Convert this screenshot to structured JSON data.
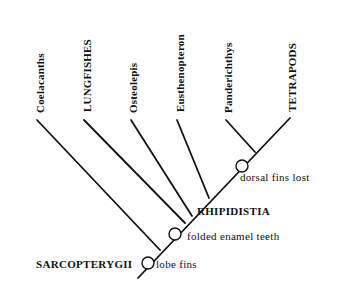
{
  "diagram": {
    "type": "cladogram",
    "taxa": [
      {
        "label": "Coelacanths",
        "tip": [
          37,
          120
        ],
        "join": [
          160,
          250
        ],
        "label_x": 44,
        "label_y": 113
      },
      {
        "label": "LUNGFISHES",
        "tip": [
          84,
          120
        ],
        "join": [
          185,
          223
        ],
        "label_x": 91,
        "label_y": 112
      },
      {
        "label": "Osteolepis",
        "tip": [
          131,
          120
        ],
        "join": [
          192,
          216
        ],
        "label_x": 137,
        "label_y": 113
      },
      {
        "label": "Eusthenopteron",
        "tip": [
          177,
          120
        ],
        "join": [
          209,
          198
        ],
        "label_x": 184,
        "label_y": 112
      },
      {
        "label": "Panderichthys",
        "tip": [
          226,
          120
        ],
        "join": [
          255,
          152
        ],
        "label_x": 232,
        "label_y": 113
      },
      {
        "label": "TETRAPODS",
        "tip": [
          290,
          118
        ],
        "join": [
          255,
          152
        ],
        "label_x": 296,
        "label_y": 112
      }
    ],
    "trunk": {
      "start": [
        138,
        278
      ],
      "end": [
        290,
        118
      ]
    },
    "clades": [
      {
        "label": "SARCOPTERYGII",
        "x": 36,
        "y": 268
      },
      {
        "label": "RHIPIDISTIA",
        "x": 197,
        "y": 215
      }
    ],
    "traits": [
      {
        "label": "lobe fins",
        "circle": [
          148,
          263
        ],
        "x": 156,
        "y": 268
      },
      {
        "label": "folded enamel teeth",
        "circle": [
          175,
          234
        ],
        "x": 187,
        "y": 240
      },
      {
        "label": "dorsal fins lost",
        "circle": [
          242,
          166
        ],
        "x": 240,
        "y": 181
      }
    ],
    "node_radius": 6
  }
}
